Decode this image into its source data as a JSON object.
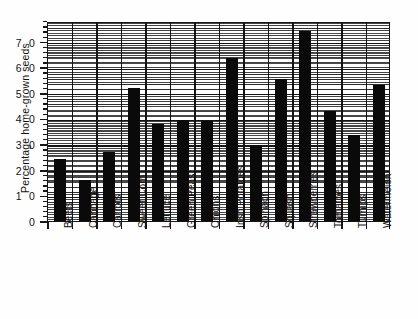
{
  "chart_data": {
    "type": "bar",
    "title": "",
    "xlabel": "",
    "ylabel": "Percentage home-grown seeds",
    "categories": [
      "Beets",
      "Cabbage",
      "Carrots",
      "Sweet Corn",
      "Lettuce",
      "Green Peas",
      "Onions",
      "Irish Potatoes",
      "Spinach",
      "Squash",
      "Strawberries",
      "Tomatoes",
      "Turnips",
      "Watermelon"
    ],
    "values": [
      24,
      16,
      27,
      52,
      38,
      39.5,
      39,
      63.5,
      29.5,
      55.5,
      74,
      43,
      33.5,
      53
    ],
    "ylim": [
      0,
      78
    ],
    "yticks": [
      0,
      10,
      20,
      30,
      40,
      50,
      60,
      70
    ],
    "ytick_labels": [
      "0",
      "1 0",
      "2 0",
      "3 0",
      "4 0",
      "5 0",
      "6 0",
      "7 0"
    ],
    "grid": "horizontal-dense-hatch-with-vertical-separators",
    "legend": "none",
    "bar_color": "#0a0a0a",
    "axis_color": "#161616"
  }
}
